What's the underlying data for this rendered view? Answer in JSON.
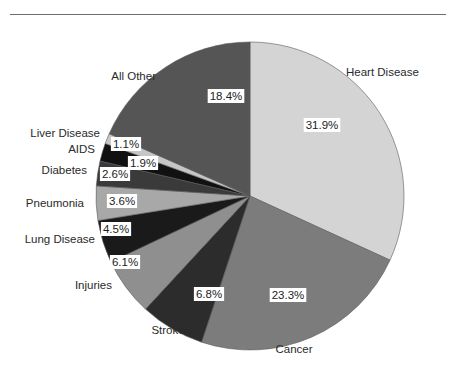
{
  "chart_data": {
    "type": "pie",
    "title": "",
    "start_angle_deg": 0,
    "direction": "clockwise",
    "slices": [
      {
        "label": "Heart Disease",
        "value": 31.9,
        "pct_label": "31.9%",
        "color": "#d4d4d4"
      },
      {
        "label": "Cancer",
        "value": 23.3,
        "pct_label": "23.3%",
        "color": "#7c7c7c"
      },
      {
        "label": "Stroke",
        "value": 6.8,
        "pct_label": "6.8%",
        "color": "#2c2c2c"
      },
      {
        "label": "Injuries",
        "value": 6.1,
        "pct_label": "6.1%",
        "color": "#8f8f8f"
      },
      {
        "label": "Lung Disease",
        "value": 4.5,
        "pct_label": "4.5%",
        "color": "#1a1a1a"
      },
      {
        "label": "Pneumonia",
        "value": 3.6,
        "pct_label": "3.6%",
        "color": "#a8a8a8"
      },
      {
        "label": "Diabetes",
        "value": 2.6,
        "pct_label": "2.6%",
        "color": "#3a3a3a"
      },
      {
        "label": "AIDS",
        "value": 1.9,
        "pct_label": "1.9%",
        "color": "#111111"
      },
      {
        "label": "Liver Disease",
        "value": 1.1,
        "pct_label": "1.1%",
        "color": "#c6c6c6"
      },
      {
        "label": "All Other",
        "value": 18.4,
        "pct_label": "18.4%",
        "color": "#555555"
      }
    ],
    "legend": "none"
  }
}
